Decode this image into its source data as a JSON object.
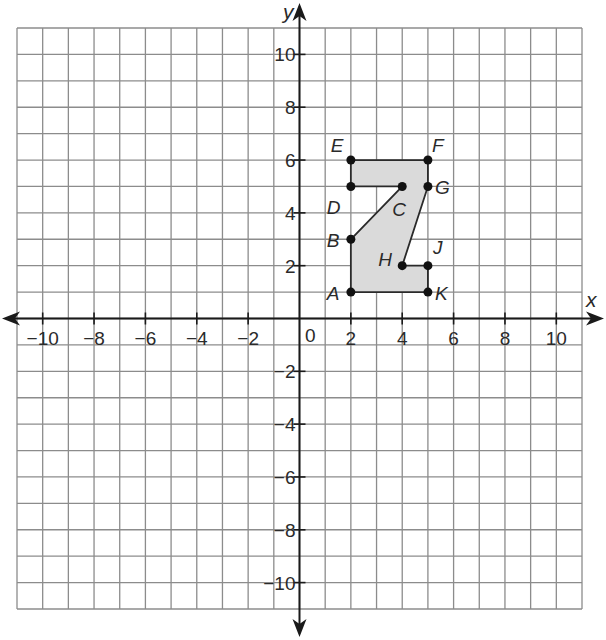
{
  "figure": {
    "axes": {
      "x_label": "x",
      "y_label": "y",
      "origin_label": "0",
      "range": [
        -11,
        11
      ],
      "x_tick_labels": [
        {
          "value": -10,
          "label": "−10"
        },
        {
          "value": -8,
          "label": "−8"
        },
        {
          "value": -6,
          "label": "−6"
        },
        {
          "value": -4,
          "label": "−4"
        },
        {
          "value": -2,
          "label": "−2"
        },
        {
          "value": 2,
          "label": "2"
        },
        {
          "value": 4,
          "label": "4"
        },
        {
          "value": 6,
          "label": "6"
        },
        {
          "value": 8,
          "label": "8"
        },
        {
          "value": 10,
          "label": "10"
        }
      ],
      "y_tick_labels": [
        {
          "value": 10,
          "label": "10"
        },
        {
          "value": 8,
          "label": "8"
        },
        {
          "value": 6,
          "label": "6"
        },
        {
          "value": 4,
          "label": "4"
        },
        {
          "value": 2,
          "label": "2"
        },
        {
          "value": -2,
          "label": "−2"
        },
        {
          "value": -4,
          "label": "−4"
        },
        {
          "value": -6,
          "label": "−6"
        },
        {
          "value": -8,
          "label": "−8"
        },
        {
          "value": -10,
          "label": "−10"
        }
      ]
    },
    "points": [
      {
        "name": "A",
        "x": 2,
        "y": 1,
        "label_dx": -24,
        "label_dy": 8
      },
      {
        "name": "B",
        "x": 2,
        "y": 3,
        "label_dx": -24,
        "label_dy": 8
      },
      {
        "name": "C",
        "x": 4,
        "y": 5,
        "label_dx": -10,
        "label_dy": 30
      },
      {
        "name": "D",
        "x": 2,
        "y": 5,
        "label_dx": -24,
        "label_dy": 28
      },
      {
        "name": "E",
        "x": 2,
        "y": 6,
        "label_dx": -20,
        "label_dy": -8
      },
      {
        "name": "F",
        "x": 5,
        "y": 6,
        "label_dx": 4,
        "label_dy": -8
      },
      {
        "name": "G",
        "x": 5,
        "y": 5,
        "label_dx": 7,
        "label_dy": 8
      },
      {
        "name": "H",
        "x": 4,
        "y": 2,
        "label_dx": -24,
        "label_dy": 0
      },
      {
        "name": "J",
        "x": 5,
        "y": 2,
        "label_dx": 5,
        "label_dy": -12
      },
      {
        "name": "K",
        "x": 5,
        "y": 1,
        "label_dx": 7,
        "label_dy": 8
      }
    ],
    "polygon_order": [
      "E",
      "F",
      "G",
      "H",
      "J",
      "K",
      "A",
      "B",
      "C",
      "D"
    ],
    "colors": {
      "fill": "#dadada",
      "grid": "#8c8c8c",
      "ink": "#1a1a1a"
    }
  }
}
